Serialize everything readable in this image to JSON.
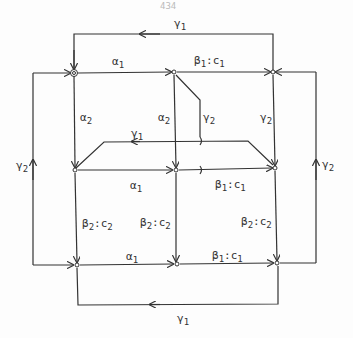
{
  "page_number": "434",
  "edges": {
    "top_loop": {
      "sym": "γ",
      "sub": "1"
    },
    "top_alpha": {
      "sym": "α",
      "sub": "1"
    },
    "top_beta": {
      "sym": "β",
      "sub": "1",
      "suffix": ":c",
      "suffix_sub": "1"
    },
    "left_alpha2": {
      "sym": "α",
      "sub": "2"
    },
    "mid_alpha2": {
      "sym": "α",
      "sub": "2"
    },
    "mid_gamma2": {
      "sym": "γ",
      "sub": "2"
    },
    "right_gamma2": {
      "sym": "γ",
      "sub": "2"
    },
    "mid_gamma1": {
      "sym": "γ",
      "sub": "1"
    },
    "left_outer_gamma2": {
      "sym": "γ",
      "sub": "2"
    },
    "right_outer_gamma2": {
      "sym": "γ",
      "sub": "2"
    },
    "mid_alpha1": {
      "sym": "α",
      "sub": "1"
    },
    "mid_beta1": {
      "sym": "β",
      "sub": "1",
      "suffix": ":c",
      "suffix_sub": "1"
    },
    "left_beta2": {
      "sym": "β",
      "sub": "2",
      "suffix": ":c",
      "suffix_sub": "2"
    },
    "mid_beta2": {
      "sym": "β",
      "sub": "2",
      "suffix": ":c",
      "suffix_sub": "2"
    },
    "right_beta2": {
      "sym": "β",
      "sub": "2",
      "suffix": ":c",
      "suffix_sub": "2"
    },
    "bot_alpha1": {
      "sym": "α",
      "sub": "1"
    },
    "bot_beta1": {
      "sym": "β",
      "sub": "1",
      "suffix": ":c",
      "suffix_sub": "1"
    },
    "bottom_loop": {
      "sym": "γ",
      "sub": "1"
    }
  }
}
